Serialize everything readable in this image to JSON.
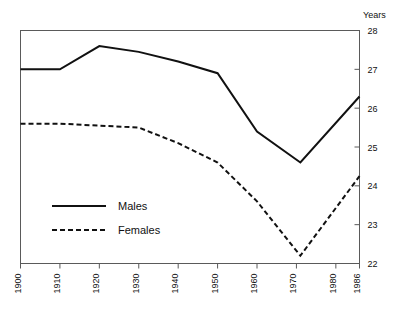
{
  "chart_data": {
    "type": "line",
    "title": "",
    "xlabel": "",
    "ylabel": "Years",
    "ylabel_position": "top-right",
    "grid": false,
    "legend_position": "inside-bottom-left",
    "x": [
      1900,
      1910,
      1920,
      1930,
      1940,
      1950,
      1960,
      1971,
      1986
    ],
    "xlim": [
      1900,
      1986
    ],
    "ylim": [
      22,
      28
    ],
    "yticks": [
      22,
      23,
      24,
      25,
      26,
      27,
      28
    ],
    "ytick_labels": [
      "22",
      "23",
      "24",
      "25",
      "26",
      "27",
      "28"
    ],
    "xticks": [
      1900,
      1910,
      1920,
      1930,
      1940,
      1950,
      1960,
      1970,
      1980,
      1986
    ],
    "xtick_labels": [
      "1900",
      "1910",
      "1920",
      "1930",
      "1940",
      "1950",
      "1960",
      "1970",
      "1980",
      "1986"
    ],
    "yaxis_side": "right",
    "series": [
      {
        "name": "Males",
        "style": "solid",
        "color": "#111111",
        "values": [
          27.0,
          27.0,
          27.6,
          27.45,
          27.2,
          26.9,
          25.4,
          24.6,
          26.3
        ]
      },
      {
        "name": "Females",
        "style": "dashed",
        "color": "#111111",
        "values": [
          25.6,
          25.6,
          25.55,
          25.5,
          25.1,
          24.6,
          23.6,
          22.2,
          24.25
        ]
      }
    ]
  },
  "legend": {
    "items": [
      {
        "label": "Males",
        "style": "solid"
      },
      {
        "label": "Females",
        "style": "dashed"
      }
    ]
  },
  "axes": {
    "y_title": "Years"
  }
}
